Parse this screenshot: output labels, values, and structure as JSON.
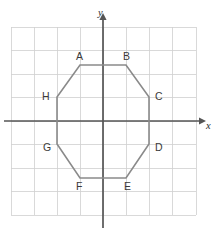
{
  "figure": {
    "background_color": "#ffffff",
    "grid": {
      "color": "#cfcfcf",
      "x_min": 11,
      "x_max": 196,
      "y_min": 27,
      "y_max": 215,
      "columns": 8,
      "rows": 8,
      "cell_size": 23.2,
      "visible": true
    },
    "axes": {
      "color": "#555555",
      "origin": {
        "x": 103,
        "y": 121
      },
      "x_axis": {
        "label": "x",
        "label_x": 206,
        "label_y": 127,
        "start_x": 4,
        "end_x": 201,
        "arrow": "right"
      },
      "y_axis": {
        "label": "y",
        "label_x": 98,
        "label_y": 14,
        "start_y": 228,
        "end_y": 18,
        "arrow": "up"
      }
    },
    "shape": {
      "name": "octagon",
      "stroke_color": "#8a8a8a",
      "fill": "none",
      "vertices": [
        {
          "label": "A",
          "x": 80,
          "y": 65,
          "label_x": 76,
          "label_y": 57
        },
        {
          "label": "B",
          "x": 126,
          "y": 65,
          "label_x": 123,
          "label_y": 57
        },
        {
          "label": "C",
          "x": 149,
          "y": 97,
          "label_x": 155,
          "label_y": 97
        },
        {
          "label": "D",
          "x": 149,
          "y": 144,
          "label_x": 155,
          "label_y": 148
        },
        {
          "label": "E",
          "x": 126,
          "y": 178,
          "label_x": 124,
          "label_y": 187
        },
        {
          "label": "F",
          "x": 80,
          "y": 178,
          "label_x": 76,
          "label_y": 187
        },
        {
          "label": "G",
          "x": 57,
          "y": 144,
          "label_x": 43,
          "label_y": 148
        },
        {
          "label": "H",
          "x": 57,
          "y": 97,
          "label_x": 42,
          "label_y": 97
        }
      ]
    }
  },
  "chart_data": {
    "type": "scatter",
    "xlabel": "x",
    "ylabel": "y",
    "xlim": [
      -4,
      4
    ],
    "ylim": [
      -4,
      4
    ],
    "grid": true,
    "legend": "none",
    "categories": [
      "A",
      "B",
      "C",
      "D",
      "E",
      "F",
      "G",
      "H"
    ],
    "series": [
      {
        "name": "Octagon vertices",
        "points": [
          {
            "label": "A",
            "x": -1,
            "y": 2.4
          },
          {
            "label": "B",
            "x": 1,
            "y": 2.4
          },
          {
            "label": "C",
            "x": 2,
            "y": 1
          },
          {
            "label": "D",
            "x": 2,
            "y": -1
          },
          {
            "label": "E",
            "x": 1,
            "y": -2.4
          },
          {
            "label": "F",
            "x": -1,
            "y": -2.4
          },
          {
            "label": "G",
            "x": -2,
            "y": -1
          },
          {
            "label": "H",
            "x": -2,
            "y": 1
          }
        ]
      }
    ],
    "annotations": [
      "Octagon is closed: A-B-C-D-E-F-G-H-A",
      "Vertices A and B lie above the x-axis on a horizontal top edge",
      "Vertices E and F lie below the x-axis on a horizontal bottom edge",
      "Vertices H and G lie on a vertical left edge crossing the x-axis",
      "Vertices C and D lie on a vertical right edge crossing the x-axis"
    ]
  }
}
